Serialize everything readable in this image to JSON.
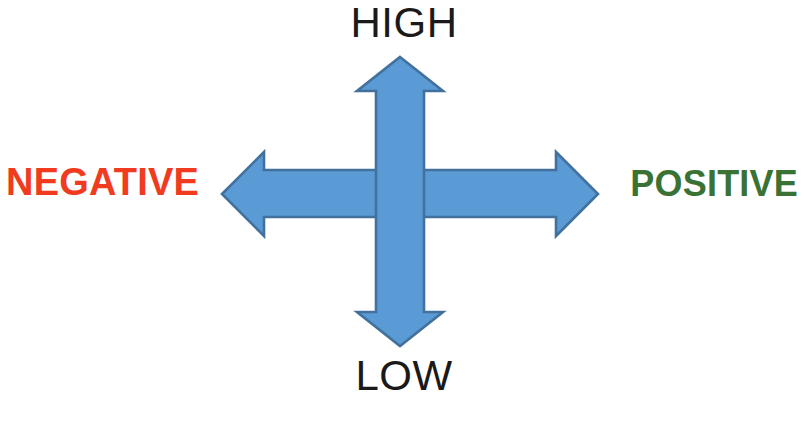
{
  "diagram": {
    "background_color": "#FFFFFF",
    "labels": {
      "top": "HIGH",
      "bottom": "LOW",
      "left": "NEGATIVE",
      "right": "POSITIVE"
    },
    "label_colors": {
      "top": "#1A1A1A",
      "bottom": "#1A1A1A",
      "left": "#F03B20",
      "right": "#3A7235"
    },
    "arrows": {
      "fill_color": "#5B9BD5",
      "outline_color": "#41719C",
      "vertical_name": "vertical-double-arrow",
      "horizontal_name": "horizontal-double-arrow",
      "directions": [
        "up",
        "down",
        "left",
        "right"
      ]
    },
    "icons": {
      "arrow_up": "arrow-up-icon",
      "arrow_down": "arrow-down-icon",
      "arrow_left": "arrow-left-icon",
      "arrow_right": "arrow-right-icon"
    }
  }
}
